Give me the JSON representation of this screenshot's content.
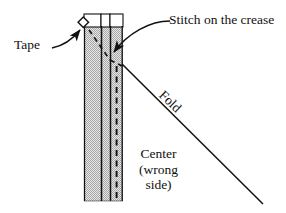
{
  "figure": {
    "background_color": "#ffffff",
    "ink_color": "#111111",
    "fabric_fill": "#d9d9d9",
    "width": 286,
    "height": 213
  },
  "labels": {
    "tape": "Tape",
    "stitch": "Stitch on the crease",
    "fold": "Fold",
    "center_line1": "Center",
    "center_line2": "(wrong",
    "center_line3": "side)"
  },
  "diagram": {
    "fabric_column": {
      "name": "hatched fabric panel",
      "left": 84,
      "right": 123,
      "top": 26,
      "bottom": 201,
      "fill": "#d8d8d8",
      "hatch": "fine checkered dot screen"
    },
    "top_tabs": {
      "name": "three white folded tabs at top",
      "count": 3,
      "top": 14,
      "bottom": 27,
      "fill": "#ffffff"
    },
    "vertical_seam_lines": [
      84,
      101,
      110,
      121
    ],
    "dashed_stitch_line": {
      "x": 116,
      "from_y": 66,
      "to_y": 200,
      "style": "dashed"
    },
    "crease_v": {
      "name": "dashed V at crease",
      "apex_x": 110,
      "apex_y": 60,
      "left_x": 90,
      "left_y": 30,
      "right_x": 122,
      "right_y": 65
    },
    "fold_line": {
      "from_x": 122,
      "from_y": 64,
      "to_x": 263,
      "to_y": 204
    },
    "tape_marker": {
      "name": "small taped square at top-left of panel",
      "x": 83,
      "y": 22,
      "size": 7,
      "rotation_deg": 45
    },
    "tape_arrow": {
      "from_x": 58,
      "from_y": 48,
      "to_x": 84,
      "to_y": 27
    },
    "stitch_arrow": {
      "from_x": 166,
      "from_y": 22,
      "to_x": 111,
      "to_y": 56
    }
  },
  "icons": {
    "tape_marker": "tape-square-icon",
    "arrow": "arrow-pointer-icon"
  }
}
